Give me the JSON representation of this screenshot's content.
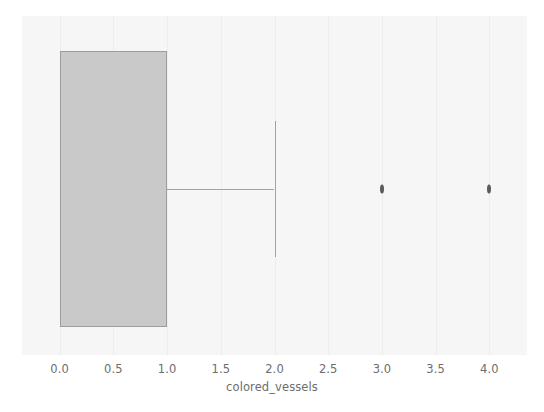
{
  "chart_data": {
    "type": "box",
    "orientation": "horizontal",
    "title": "",
    "xlabel": "colored_vessels",
    "ylabel": "",
    "xlim": [
      -0.35,
      4.35
    ],
    "grid": true,
    "legend": null,
    "xticks": [
      {
        "value": 0.0,
        "label": "0.0"
      },
      {
        "value": 0.5,
        "label": "0.5"
      },
      {
        "value": 1.0,
        "label": "1.0"
      },
      {
        "value": 1.5,
        "label": "1.5"
      },
      {
        "value": 2.0,
        "label": "2.0"
      },
      {
        "value": 2.5,
        "label": "2.5"
      },
      {
        "value": 3.0,
        "label": "3.0"
      },
      {
        "value": 3.5,
        "label": "3.5"
      },
      {
        "value": 4.0,
        "label": "4.0"
      }
    ],
    "series": [
      {
        "name": "colored_vessels",
        "q1": 0.0,
        "median": 0.0,
        "q3": 1.0,
        "whisker_low": 0.0,
        "whisker_high": 2.0,
        "outliers": [
          3.0,
          4.0
        ]
      }
    ],
    "colors": {
      "box_fill": "#c9c9c9",
      "box_edge": "#9d9d9d",
      "whisker": "#a2a2a2",
      "outlier": "#5b5b5b",
      "plot_background": "#f6f6f7",
      "figure_background": "#ffffff",
      "gridline": "#ededee",
      "tick_text": "#6d6d6d"
    }
  }
}
